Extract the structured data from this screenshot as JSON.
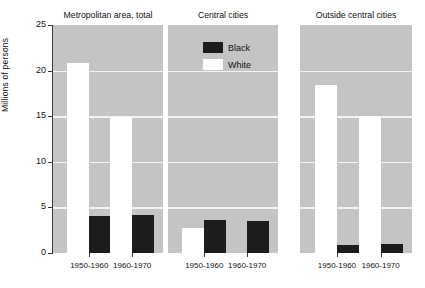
{
  "chart_data": {
    "type": "bar",
    "title": "",
    "xlabel": "",
    "ylabel": "Millions of persons",
    "ylim": [
      0,
      25
    ],
    "ytick_labels": [
      "25",
      "20",
      "15",
      "10",
      "5",
      "0"
    ],
    "ytick_values": [
      25,
      20,
      15,
      10,
      5,
      0
    ],
    "grid": true,
    "legend_position": "inside-center-panel-top",
    "categories": [
      "1950-1960",
      "1960-1970"
    ],
    "series": [
      {
        "name": "Black",
        "color": "#1c1c1c"
      },
      {
        "name": "White",
        "color": "#ffffff"
      }
    ],
    "panels": [
      {
        "title": "Metropolitan area, total",
        "bars": [
          {
            "category": "1950-1960",
            "series": "White",
            "value": 20.8
          },
          {
            "category": "1950-1960",
            "series": "Black",
            "value": 4.1
          },
          {
            "category": "1960-1970",
            "series": "White",
            "value": 14.9
          },
          {
            "category": "1960-1970",
            "series": "Black",
            "value": 4.2
          }
        ]
      },
      {
        "title": "Central cities",
        "bars": [
          {
            "category": "1950-1960",
            "series": "White",
            "value": 2.7
          },
          {
            "category": "1950-1960",
            "series": "Black",
            "value": 3.6
          },
          {
            "category": "1960-1970",
            "series": "White",
            "value": 0
          },
          {
            "category": "1960-1970",
            "series": "Black",
            "value": 3.5
          }
        ]
      },
      {
        "title": "Outside central cities",
        "bars": [
          {
            "category": "1950-1960",
            "series": "White",
            "value": 18.4
          },
          {
            "category": "1950-1960",
            "series": "Black",
            "value": 0.9
          },
          {
            "category": "1960-1970",
            "series": "White",
            "value": 15.0
          },
          {
            "category": "1960-1970",
            "series": "Black",
            "value": 1.0
          }
        ]
      }
    ]
  },
  "axis": {
    "y_title": "Millions of persons",
    "y_labels": [
      "25",
      "20",
      "15",
      "10",
      "5",
      "0"
    ],
    "x_labels": [
      "1950-1960",
      "1960-1970"
    ]
  },
  "legend": {
    "items": [
      {
        "label": "Black",
        "swatch": "black"
      },
      {
        "label": "White",
        "swatch": "white"
      }
    ]
  },
  "panels": [
    {
      "title": "Metropolitan area, total"
    },
    {
      "title": "Central cities"
    },
    {
      "title": "Outside central cities"
    }
  ]
}
